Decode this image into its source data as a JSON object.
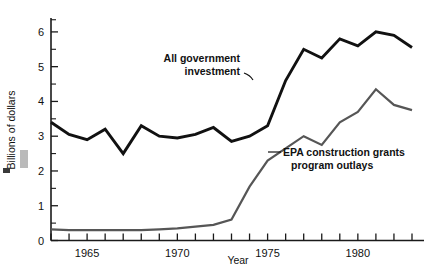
{
  "chart_data": {
    "type": "line",
    "title": "",
    "xlabel": "Year",
    "ylabel": "Billions of dollars",
    "xlim": [
      1963,
      1983
    ],
    "ylim": [
      0,
      6.4
    ],
    "grid": false,
    "legend_position": "inline-annotation",
    "yticks": [
      0,
      1,
      2,
      3,
      4,
      5,
      6
    ],
    "ytick_labels": [
      "0",
      "1",
      "2",
      "3",
      "4",
      "5",
      "6"
    ],
    "y_minor_interval": 0.5,
    "xticks": [
      1963,
      1964,
      1965,
      1966,
      1967,
      1968,
      1969,
      1970,
      1971,
      1972,
      1973,
      1974,
      1975,
      1976,
      1977,
      1978,
      1979,
      1980,
      1981,
      1982,
      1983
    ],
    "xtick_labels_shown": [
      "1965",
      "1970",
      "1975",
      "1980"
    ],
    "xtick_label_years": [
      1965,
      1970,
      1975,
      1980
    ],
    "x": [
      1963,
      1964,
      1965,
      1966,
      1967,
      1968,
      1969,
      1970,
      1971,
      1972,
      1973,
      1974,
      1975,
      1976,
      1977,
      1978,
      1979,
      1980,
      1981,
      1982,
      1983
    ],
    "series": [
      {
        "name": "All government investment",
        "color": "#111111",
        "values": [
          3.4,
          3.05,
          2.9,
          3.2,
          2.5,
          3.3,
          3.0,
          2.95,
          3.05,
          3.25,
          2.85,
          3.0,
          3.3,
          4.6,
          5.5,
          5.25,
          5.8,
          5.6,
          6.0,
          5.9,
          5.55
        ]
      },
      {
        "name": "EPA construction grants program outlays",
        "color": "#565656",
        "values": [
          0.32,
          0.3,
          0.3,
          0.3,
          0.3,
          0.3,
          0.32,
          0.35,
          0.4,
          0.45,
          0.6,
          1.55,
          2.3,
          2.65,
          3.0,
          2.75,
          3.4,
          3.7,
          4.35,
          3.9,
          3.75
        ]
      }
    ],
    "annotations": [
      {
        "text_line1": "All government",
        "text_line2": "investment",
        "target_series": "All government investment"
      },
      {
        "text_line1": "EPA construction grants",
        "text_line2": "program outlays",
        "target_series": "EPA construction grants program outlays"
      }
    ]
  },
  "annotation_gov": {
    "line1": "All government",
    "line2": "investment"
  },
  "annotation_epa": {
    "line1": "EPA construction grants",
    "line2": "program outlays"
  },
  "axes": {
    "y_title": "Billions of dollars",
    "x_title": "Year",
    "y_labels": [
      "6",
      "5",
      "4",
      "3",
      "2",
      "1",
      "0"
    ],
    "x_labels": [
      "1965",
      "1970",
      "1975",
      "1980"
    ]
  }
}
